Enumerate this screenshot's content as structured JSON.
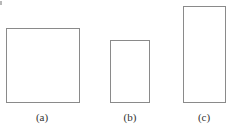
{
  "figure": {
    "shapes": [
      {
        "id": "a",
        "label": "(a)",
        "shape": "rectangle",
        "x": 6,
        "y": 28,
        "width": 74,
        "height": 75
      },
      {
        "id": "b",
        "label": "(b)",
        "shape": "rectangle",
        "x": 110,
        "y": 40,
        "width": 40,
        "height": 63
      },
      {
        "id": "c",
        "label": "(c)",
        "shape": "rectangle",
        "x": 183,
        "y": 6,
        "width": 43,
        "height": 97
      }
    ],
    "colors": {
      "stroke": "#8a8a8a",
      "label": "#333333",
      "background": "#ffffff"
    }
  }
}
